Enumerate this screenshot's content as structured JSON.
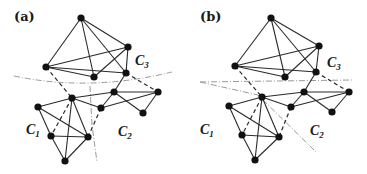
{
  "figure": {
    "panels": [
      {
        "id": "a",
        "label": "(a)",
        "clusters": [
          {
            "name": "C",
            "sub": "1"
          },
          {
            "name": "C",
            "sub": "2"
          },
          {
            "name": "C",
            "sub": "3"
          }
        ],
        "nodes": [
          [
            81,
            18
          ],
          [
            128,
            47
          ],
          [
            46,
            67
          ],
          [
            94,
            77
          ],
          [
            126,
            73
          ],
          [
            72,
            98
          ],
          [
            114,
            92
          ],
          [
            158,
            92
          ],
          [
            101,
            108
          ],
          [
            143,
            113
          ],
          [
            38,
            107
          ],
          [
            51,
            136
          ],
          [
            88,
            137
          ],
          [
            65,
            161
          ]
        ],
        "edges": [
          [
            0,
            1
          ],
          [
            0,
            2
          ],
          [
            0,
            3
          ],
          [
            0,
            4
          ],
          [
            2,
            1
          ],
          [
            2,
            3
          ],
          [
            2,
            4
          ],
          [
            3,
            1
          ],
          [
            1,
            4
          ],
          [
            6,
            7
          ],
          [
            6,
            8
          ],
          [
            6,
            9
          ],
          [
            8,
            7
          ],
          [
            7,
            9
          ],
          [
            5,
            6
          ],
          [
            4,
            6
          ],
          [
            5,
            10
          ],
          [
            5,
            12
          ],
          [
            5,
            13
          ],
          [
            10,
            11
          ],
          [
            10,
            12
          ],
          [
            11,
            12
          ],
          [
            11,
            13
          ],
          [
            12,
            13
          ]
        ],
        "dashed_edges": [
          [
            2,
            5
          ],
          [
            4,
            7
          ],
          [
            5,
            11
          ],
          [
            8,
            12
          ]
        ],
        "cut_lines": "vertical-and-curved"
      },
      {
        "id": "b",
        "label": "(b)",
        "clusters": [
          {
            "name": "C",
            "sub": "1"
          },
          {
            "name": "C",
            "sub": "2"
          },
          {
            "name": "C",
            "sub": "3"
          }
        ],
        "nodes": [
          [
            271,
            18
          ],
          [
            319,
            46
          ],
          [
            235,
            66
          ],
          [
            285,
            77
          ],
          [
            316,
            72
          ],
          [
            262,
            97
          ],
          [
            304,
            92
          ],
          [
            349,
            92
          ],
          [
            291,
            107
          ],
          [
            332,
            112
          ],
          [
            229,
            106
          ],
          [
            242,
            135
          ],
          [
            279,
            137
          ],
          [
            255,
            160
          ]
        ],
        "edges": [
          [
            0,
            1
          ],
          [
            0,
            2
          ],
          [
            0,
            3
          ],
          [
            0,
            4
          ],
          [
            2,
            1
          ],
          [
            2,
            3
          ],
          [
            2,
            4
          ],
          [
            3,
            1
          ],
          [
            1,
            4
          ],
          [
            6,
            7
          ],
          [
            6,
            8
          ],
          [
            6,
            9
          ],
          [
            8,
            7
          ],
          [
            7,
            9
          ],
          [
            5,
            6
          ],
          [
            4,
            6
          ],
          [
            5,
            10
          ],
          [
            5,
            12
          ],
          [
            5,
            13
          ],
          [
            10,
            11
          ],
          [
            10,
            12
          ],
          [
            11,
            12
          ],
          [
            11,
            13
          ],
          [
            12,
            13
          ]
        ],
        "dashed_edges": [
          [
            2,
            5
          ],
          [
            4,
            7
          ],
          [
            5,
            11
          ],
          [
            8,
            12
          ]
        ],
        "cut_lines": "straight-crossing"
      }
    ]
  }
}
